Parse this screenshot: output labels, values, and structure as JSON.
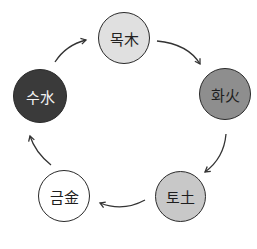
{
  "diagram": {
    "title": "",
    "nodes": [
      {
        "id": "wood",
        "label": "목木",
        "fill": "#e0e0e0",
        "text_color": "#222222"
      },
      {
        "id": "fire",
        "label": "화火",
        "fill": "#8e8e8e",
        "text_color": "#1e1e1e"
      },
      {
        "id": "earth",
        "label": "토土",
        "fill": "#c8c8c8",
        "text_color": "#1e1e1e"
      },
      {
        "id": "metal",
        "label": "금金",
        "fill": "#ffffff",
        "text_color": "#1e1e1e"
      },
      {
        "id": "water",
        "label": "수水",
        "fill": "#3a3a3a",
        "text_color": "#f2f2f2"
      }
    ],
    "edges": [
      {
        "from": "wood",
        "to": "fire"
      },
      {
        "from": "fire",
        "to": "earth"
      },
      {
        "from": "earth",
        "to": "metal"
      },
      {
        "from": "metal",
        "to": "water"
      },
      {
        "from": "water",
        "to": "wood"
      }
    ],
    "edge_color": "#333333"
  }
}
